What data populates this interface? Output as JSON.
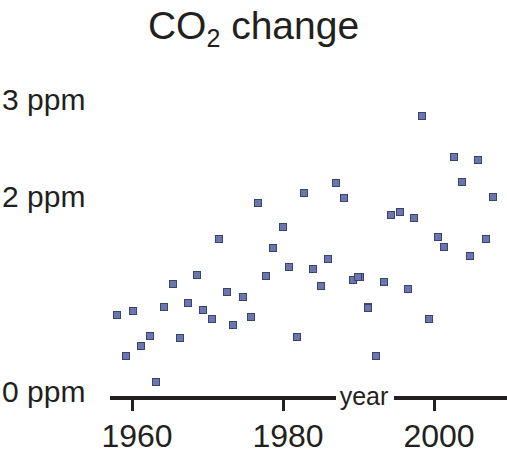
{
  "chart_data": {
    "type": "scatter",
    "title": "CO2 change",
    "title_main": "CO",
    "title_sub": "2",
    "title_tail": " change",
    "xlabel": "year",
    "ylabel": "",
    "xlim": [
      1956.5,
      2010.5
    ],
    "ylim": [
      0,
      3.2
    ],
    "grid": false,
    "legend": null,
    "xticks": [
      1960,
      1980,
      2000
    ],
    "xtick_labels": [
      "1960",
      "1980",
      "2000"
    ],
    "yticks": [
      0,
      2,
      3
    ],
    "ytick_labels": [
      "0 ppm",
      "2 ppm",
      "3 ppm"
    ],
    "marker": "square",
    "marker_color": "#6b77ab",
    "marker_edge_color": "#3a4272",
    "axis_color": "#231f20",
    "background": "#ffffff",
    "series": [
      {
        "name": "CO2 annual change",
        "x": [
          1959,
          1960,
          1961,
          1962,
          1963,
          1964,
          1965,
          1966,
          1967,
          1968,
          1969,
          1970,
          1971,
          1972,
          1973,
          1974,
          1975,
          1976,
          1977,
          1978,
          1979,
          1980,
          1981,
          1982,
          1983,
          1984,
          1985,
          1986,
          1987,
          1988,
          1989,
          1990,
          1991,
          1992,
          1993,
          1994,
          1995,
          1996,
          1997,
          1998,
          1999,
          2000,
          2001,
          2002,
          2003,
          2004,
          2005,
          2006,
          2007,
          2008,
          2009
        ],
        "y": [
          0.79,
          0.84,
          0.37,
          0.47,
          0.58,
          0.1,
          0.88,
          1.11,
          0.56,
          0.92,
          1.21,
          0.85,
          0.75,
          1.58,
          1.03,
          0.69,
          1.95,
          1.7,
          1.49,
          2.05,
          2.16,
          2.0,
          1.29,
          1.2,
          1.27,
          1.37,
          1.09,
          0.98,
          1.37,
          1.74,
          1.19,
          0.59,
          1.15,
          1.63,
          0.41,
          1.93,
          1.85,
          1.79,
          1.34,
          2.85,
          2.42,
          2.17,
          2.16,
          1.59,
          2.01,
          1.49,
          1.4,
          2.51,
          2.16,
          1.95,
          1.58
        ],
        "points_px": [
          [
            117,
            315
          ],
          [
            133,
            311
          ],
          [
            126,
            356
          ],
          [
            141,
            346
          ],
          [
            150,
            336
          ],
          [
            156,
            382
          ],
          [
            164,
            307
          ],
          [
            173,
            284
          ],
          [
            180,
            338
          ],
          [
            188,
            303
          ],
          [
            197,
            275
          ],
          [
            203,
            310
          ],
          [
            212,
            319
          ],
          [
            219,
            239
          ],
          [
            227,
            292
          ],
          [
            233,
            325
          ],
          [
            243,
            297
          ],
          [
            251,
            317
          ],
          [
            258,
            203
          ],
          [
            266,
            276
          ],
          [
            273,
            248
          ],
          [
            283,
            227
          ],
          [
            289,
            267
          ],
          [
            297,
            337
          ],
          [
            304,
            193
          ],
          [
            313,
            269
          ],
          [
            321,
            286
          ],
          [
            328,
            259
          ],
          [
            336,
            183
          ],
          [
            344,
            198
          ],
          [
            353,
            280
          ],
          [
            360,
            277
          ],
          [
            368,
            307
          ],
          [
            376,
            356
          ],
          [
            384,
            282
          ],
          [
            391,
            215
          ],
          [
            400,
            212
          ],
          [
            408,
            289
          ],
          [
            414,
            218
          ],
          [
            422,
            116
          ],
          [
            429,
            319
          ],
          [
            438,
            237
          ],
          [
            444,
            247
          ],
          [
            454,
            157
          ],
          [
            462,
            182
          ],
          [
            470,
            256
          ],
          [
            478,
            160
          ],
          [
            486,
            239
          ],
          [
            493,
            197
          ],
          [
            358,
            277
          ],
          [
            368,
            308
          ]
        ]
      }
    ]
  },
  "axes": {
    "x_axis_label": "year",
    "x_axis_label_x": 364,
    "x_axis_label_y": 396,
    "segments": [
      {
        "left": 110,
        "top": 396,
        "width": 226
      },
      {
        "left": 394,
        "top": 396,
        "width": 113
      }
    ],
    "ticks": [
      {
        "x": 131,
        "label": "1960",
        "label_x": 137,
        "label_y": 420
      },
      {
        "x": 282,
        "label": "1980",
        "label_x": 288,
        "label_y": 420
      },
      {
        "x": 433,
        "label": "2000",
        "label_x": 439,
        "label_y": 420
      }
    ],
    "y_labels": [
      {
        "text": "3 ppm",
        "y": 100
      },
      {
        "text": "2 ppm",
        "y": 197
      },
      {
        "text": "0 ppm",
        "y": 392
      }
    ]
  }
}
